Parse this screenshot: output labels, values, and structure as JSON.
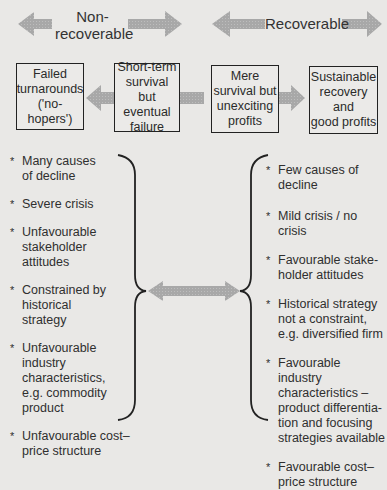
{
  "header": {
    "non_recoverable_label": "Non-\nrecoverable",
    "recoverable_label": "Recoverable"
  },
  "boxes": [
    {
      "label": "Failed\nturnarounds\n('no-hopers')"
    },
    {
      "label": "Short-term\nsurvival\nbut eventual\nfailure"
    },
    {
      "label": "Mere\nsurvival but\nunexciting\nprofits"
    },
    {
      "label": "Sustainable\nrecovery and\ngood profits"
    }
  ],
  "left_list": [
    "Many causes\nof decline",
    "Severe crisis",
    "Unfavourable\nstakeholder\nattitudes",
    "Constrained by\nhistorical\nstrategy",
    "Unfavourable\nindustry\ncharacteristics,\ne.g. commodity\nproduct",
    "Unfavourable cost–\nprice structure"
  ],
  "right_list": [
    "Few causes of\ndecline",
    "Mild crisis / no crisis",
    "Favourable stake-\nholder attitudes",
    "Historical strategy\nnot a constraint,\ne.g. diversified firm",
    "Favourable industry\ncharacteristics –\nproduct differentia-\ntion and focusing\nstrategies available",
    "Favourable cost–\nprice structure"
  ],
  "colors": {
    "background": "#e9e8e6",
    "arrow_fill": "#a9a9a9",
    "border": "#222222"
  }
}
